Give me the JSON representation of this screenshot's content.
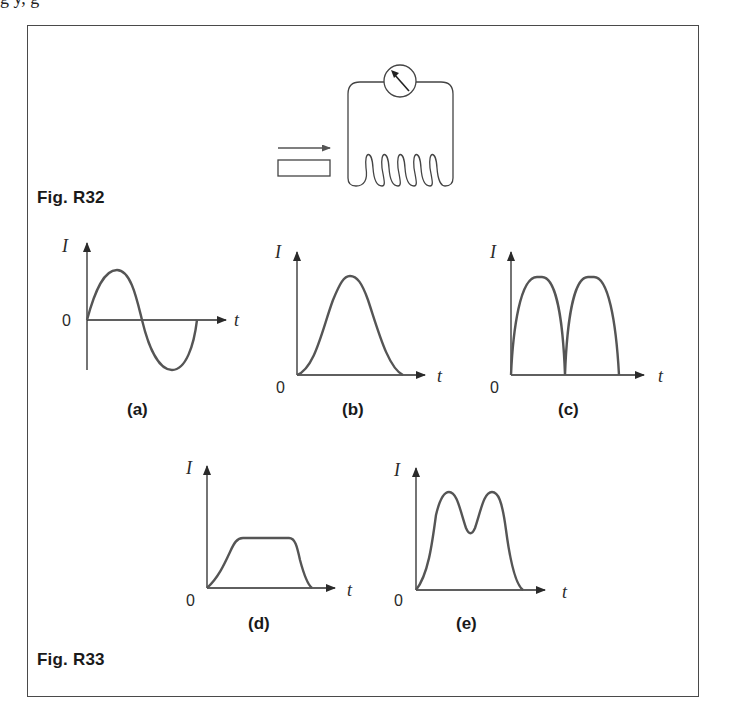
{
  "header": {
    "cutoff_text": "g                                                                                    y, g"
  },
  "figures": {
    "r32": {
      "label": "Fig. R32",
      "description": "Bar magnet moving toward a coil connected to a galvanometer"
    },
    "r33": {
      "label": "Fig. R33",
      "graphs": [
        {
          "id": "a",
          "label": "(a)",
          "y_axis": "I",
          "x_axis": "t",
          "origin": "0",
          "shape": "full sine wave (positive then negative)"
        },
        {
          "id": "b",
          "label": "(b)",
          "y_axis": "I",
          "x_axis": "t",
          "origin": "0",
          "shape": "single bell-shaped positive pulse"
        },
        {
          "id": "c",
          "label": "(c)",
          "y_axis": "I",
          "x_axis": "t",
          "origin": "0",
          "shape": "two positive arches (rectified sine)"
        },
        {
          "id": "d",
          "label": "(d)",
          "y_axis": "I",
          "x_axis": "t",
          "origin": "0",
          "shape": "trapezoid pulse with flat top"
        },
        {
          "id": "e",
          "label": "(e)",
          "y_axis": "I",
          "x_axis": "t",
          "origin": "0",
          "shape": "double-humped positive pulse"
        }
      ]
    }
  },
  "colors": {
    "line": "#4a4a4a",
    "curve": "#555555",
    "text": "#1a1a1a",
    "background": "#ffffff"
  }
}
